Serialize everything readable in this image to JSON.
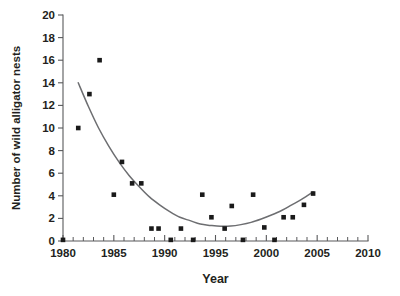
{
  "chart_data": {
    "type": "scatter",
    "title": "",
    "xlabel": "Year",
    "ylabel": "Number of wild alligator nests",
    "xlim": [
      1980,
      2010
    ],
    "ylim": [
      0,
      20
    ],
    "xticks": [
      1980,
      1985,
      1990,
      1995,
      2000,
      2005,
      2010
    ],
    "xtick_labels": [
      "1980",
      "1985",
      "1990",
      "1995",
      "2000",
      "2005",
      "2010"
    ],
    "xminor_tick_step": 1,
    "yticks": [
      0,
      2,
      4,
      6,
      8,
      10,
      12,
      14,
      16,
      18,
      20
    ],
    "ytick_labels": [
      "0",
      "2",
      "4",
      "6",
      "8",
      "10",
      "12",
      "14",
      "16",
      "18",
      "20"
    ],
    "grid": false,
    "legend": null,
    "marker": "square",
    "marker_color": "#1a1a1a",
    "series": [
      {
        "name": "wild alligator nests",
        "points": [
          {
            "x": 1980.0,
            "y": 0.1
          },
          {
            "x": 1981.5,
            "y": 10.0
          },
          {
            "x": 1982.6,
            "y": 13.0
          },
          {
            "x": 1983.6,
            "y": 16.0
          },
          {
            "x": 1985.0,
            "y": 4.1
          },
          {
            "x": 1985.8,
            "y": 7.0
          },
          {
            "x": 1986.8,
            "y": 5.1
          },
          {
            "x": 1987.7,
            "y": 5.1
          },
          {
            "x": 1988.7,
            "y": 1.1
          },
          {
            "x": 1989.4,
            "y": 1.1
          },
          {
            "x": 1990.6,
            "y": 0.1
          },
          {
            "x": 1991.6,
            "y": 1.1
          },
          {
            "x": 1992.8,
            "y": 0.1
          },
          {
            "x": 1993.7,
            "y": 4.1
          },
          {
            "x": 1994.6,
            "y": 2.1
          },
          {
            "x": 1995.9,
            "y": 1.1
          },
          {
            "x": 1996.6,
            "y": 3.1
          },
          {
            "x": 1997.7,
            "y": 0.1
          },
          {
            "x": 1998.7,
            "y": 4.1
          },
          {
            "x": 1999.8,
            "y": 1.2
          },
          {
            "x": 2000.8,
            "y": 0.1
          },
          {
            "x": 2001.7,
            "y": 2.1
          },
          {
            "x": 2002.6,
            "y": 2.1
          },
          {
            "x": 2003.7,
            "y": 3.2
          },
          {
            "x": 2004.6,
            "y": 4.2
          }
        ]
      }
    ],
    "fit_curve": {
      "type": "quadratic-fit",
      "color": "#6d6e71",
      "x_start": 1981.5,
      "x_end": 2004.6,
      "vertex_x": 1996.0,
      "vertex_y": 1.3,
      "points": [
        {
          "x": 1981.5,
          "y": 14.0
        },
        {
          "x": 1982.5,
          "y": 11.9
        },
        {
          "x": 1983.5,
          "y": 10.0
        },
        {
          "x": 1984.5,
          "y": 8.4
        },
        {
          "x": 1985.5,
          "y": 7.0
        },
        {
          "x": 1986.5,
          "y": 5.8
        },
        {
          "x": 1987.5,
          "y": 4.8
        },
        {
          "x": 1988.5,
          "y": 3.9
        },
        {
          "x": 1989.5,
          "y": 3.2
        },
        {
          "x": 1990.5,
          "y": 2.6
        },
        {
          "x": 1991.5,
          "y": 2.1
        },
        {
          "x": 1992.5,
          "y": 1.8
        },
        {
          "x": 1993.5,
          "y": 1.5
        },
        {
          "x": 1994.5,
          "y": 1.38
        },
        {
          "x": 1995.5,
          "y": 1.3
        },
        {
          "x": 1996.5,
          "y": 1.32
        },
        {
          "x": 1997.5,
          "y": 1.45
        },
        {
          "x": 1998.5,
          "y": 1.65
        },
        {
          "x": 1999.5,
          "y": 1.95
        },
        {
          "x": 2000.5,
          "y": 2.3
        },
        {
          "x": 2001.5,
          "y": 2.7
        },
        {
          "x": 2002.5,
          "y": 3.2
        },
        {
          "x": 2003.5,
          "y": 3.7
        },
        {
          "x": 2004.6,
          "y": 4.35
        }
      ]
    }
  }
}
